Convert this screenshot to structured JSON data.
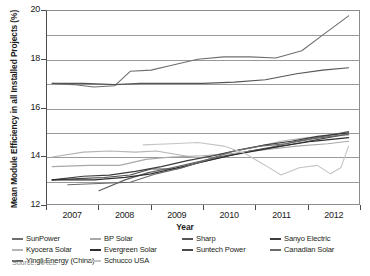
{
  "chart_data": {
    "type": "line",
    "title": "",
    "xlabel": "Year",
    "ylabel": "Mean Module Efficiency in all Installed Projects (%)",
    "x": [
      "2007",
      "2008",
      "2009",
      "2010",
      "2011",
      "2012"
    ],
    "xlim": [
      2006.5,
      2012.5
    ],
    "ylim": [
      12,
      20
    ],
    "yticks": [
      12,
      14,
      16,
      18,
      20
    ],
    "ytick_labels": [
      "12",
      "14",
      "16",
      "18",
      "20"
    ],
    "gridlines": [
      13,
      15,
      17,
      19
    ],
    "grid": true,
    "legend_position": "bottom",
    "source": "Source: NREL",
    "series": [
      {
        "name": "SunPower",
        "color": "#6e6e6e",
        "width": 1.1,
        "values": [
          17.0,
          16.95,
          17.55,
          17.9,
          18.1,
          19.8
        ],
        "points": [
          [
            2006.6,
            17.0
          ],
          [
            2007.0,
            16.95
          ],
          [
            2007.4,
            16.85
          ],
          [
            2007.8,
            16.9
          ],
          [
            2008.1,
            17.5
          ],
          [
            2008.5,
            17.55
          ],
          [
            2008.9,
            17.75
          ],
          [
            2009.4,
            18.0
          ],
          [
            2009.9,
            18.1
          ],
          [
            2010.4,
            18.1
          ],
          [
            2010.9,
            18.05
          ],
          [
            2011.4,
            18.35
          ],
          [
            2011.8,
            19.0
          ],
          [
            2012.3,
            19.8
          ]
        ]
      },
      {
        "name": "Sharp",
        "color": "#555555",
        "width": 1.1,
        "values": [
          17.0,
          17.0,
          17.0,
          17.0,
          17.1,
          17.65
        ],
        "points": [
          [
            2006.6,
            17.0
          ],
          [
            2007.2,
            17.0
          ],
          [
            2007.8,
            16.95
          ],
          [
            2008.3,
            17.0
          ],
          [
            2008.9,
            17.0
          ],
          [
            2009.5,
            17.0
          ],
          [
            2010.1,
            17.05
          ],
          [
            2010.7,
            17.15
          ],
          [
            2011.3,
            17.4
          ],
          [
            2011.8,
            17.55
          ],
          [
            2012.3,
            17.65
          ]
        ]
      },
      {
        "name": "Kyocera Solar",
        "color": "#b4b4b4",
        "width": 1.1,
        "values": [
          13.95,
          14.2,
          14.1,
          14.3,
          14.7,
          14.85
        ],
        "points": [
          [
            2006.6,
            13.95
          ],
          [
            2007.2,
            14.15
          ],
          [
            2007.7,
            14.2
          ],
          [
            2008.2,
            14.15
          ],
          [
            2008.6,
            14.2
          ],
          [
            2009.0,
            14.05
          ],
          [
            2009.4,
            13.9
          ],
          [
            2009.9,
            14.1
          ],
          [
            2010.5,
            14.35
          ],
          [
            2011.0,
            14.6
          ],
          [
            2011.5,
            14.75
          ],
          [
            2012.3,
            14.85
          ]
        ]
      },
      {
        "name": "Suntech Power",
        "color": "#4a4a4a",
        "width": 1.1,
        "values": [
          13.0,
          13.05,
          13.5,
          14.0,
          14.45,
          14.9
        ],
        "points": [
          [
            2006.6,
            13.0
          ],
          [
            2007.1,
            13.05
          ],
          [
            2007.6,
            13.1
          ],
          [
            2008.1,
            13.2
          ],
          [
            2008.5,
            13.45
          ],
          [
            2009.0,
            13.45
          ],
          [
            2009.4,
            13.7
          ],
          [
            2009.9,
            13.95
          ],
          [
            2010.4,
            14.2
          ],
          [
            2010.9,
            14.35
          ],
          [
            2011.4,
            14.55
          ],
          [
            2011.9,
            14.75
          ],
          [
            2012.3,
            14.9
          ]
        ]
      },
      {
        "name": "Yingli Energy (China)",
        "color": "#5e5e5e",
        "width": 1.1,
        "values": [
          12.55,
          12.95,
          13.6,
          14.1,
          14.55,
          15.0
        ],
        "points": [
          [
            2007.5,
            12.55
          ],
          [
            2008.0,
            13.0
          ],
          [
            2008.45,
            13.3
          ],
          [
            2008.9,
            13.5
          ],
          [
            2009.3,
            13.7
          ],
          [
            2009.8,
            13.95
          ],
          [
            2010.3,
            14.15
          ],
          [
            2010.8,
            14.35
          ],
          [
            2011.3,
            14.6
          ],
          [
            2011.8,
            14.8
          ],
          [
            2012.3,
            15.0
          ]
        ]
      },
      {
        "name": "BP Solar",
        "color": "#a8a8a8",
        "width": 1.1,
        "values": [
          13.55,
          13.6,
          13.85,
          14.05,
          14.3,
          14.6
        ],
        "points": [
          [
            2006.6,
            13.55
          ],
          [
            2007.3,
            13.6
          ],
          [
            2007.9,
            13.6
          ],
          [
            2008.4,
            13.85
          ],
          [
            2008.9,
            13.95
          ],
          [
            2009.5,
            14.0
          ],
          [
            2010.1,
            14.1
          ],
          [
            2010.7,
            14.25
          ],
          [
            2011.3,
            14.4
          ],
          [
            2011.9,
            14.5
          ],
          [
            2012.3,
            14.6
          ]
        ]
      },
      {
        "name": "Sanyo Electric",
        "color": "#3d3d3d",
        "width": 1.2,
        "values": [
          13.0,
          13.1,
          13.35,
          13.95,
          14.45,
          14.95
        ],
        "points": [
          [
            2006.6,
            13.0
          ],
          [
            2007.2,
            13.15
          ],
          [
            2007.7,
            13.2
          ],
          [
            2008.2,
            13.35
          ],
          [
            2008.7,
            13.55
          ],
          [
            2009.2,
            13.8
          ],
          [
            2009.7,
            14.0
          ],
          [
            2010.2,
            14.25
          ],
          [
            2010.7,
            14.45
          ],
          [
            2011.2,
            14.6
          ],
          [
            2011.7,
            14.8
          ],
          [
            2012.3,
            14.95
          ]
        ]
      },
      {
        "name": "Evergreen Solar",
        "color": "#2e2e2e",
        "width": 1.2,
        "values": [
          13.0,
          13.05,
          13.3,
          13.85,
          14.4,
          14.75
        ],
        "points": [
          [
            2006.6,
            13.0
          ],
          [
            2007.4,
            13.0
          ],
          [
            2008.0,
            13.1
          ],
          [
            2008.5,
            13.25
          ],
          [
            2009.0,
            13.5
          ],
          [
            2009.5,
            13.75
          ],
          [
            2010.0,
            14.0
          ],
          [
            2010.5,
            14.2
          ],
          [
            2011.0,
            14.4
          ],
          [
            2011.6,
            14.6
          ],
          [
            2012.3,
            14.75
          ]
        ]
      },
      {
        "name": "Canadian Solar",
        "color": "#6a6a6a",
        "width": 1.1,
        "values": [
          12.8,
          12.9,
          13.45,
          14.3,
          14.5,
          14.9
        ],
        "points": [
          [
            2006.9,
            12.8
          ],
          [
            2007.5,
            12.85
          ],
          [
            2008.1,
            12.9
          ],
          [
            2008.6,
            13.25
          ],
          [
            2009.1,
            13.5
          ],
          [
            2009.6,
            13.85
          ],
          [
            2010.1,
            14.2
          ],
          [
            2010.6,
            14.4
          ],
          [
            2011.1,
            14.5
          ],
          [
            2011.6,
            14.7
          ],
          [
            2012.3,
            14.9
          ]
        ]
      },
      {
        "name": "Schucco USA",
        "color": "#c4c4c4",
        "width": 1.1,
        "values": [
          14.45,
          14.6,
          14.3,
          13.6,
          13.2,
          14.4
        ],
        "points": [
          [
            2008.35,
            14.45
          ],
          [
            2008.9,
            14.5
          ],
          [
            2009.4,
            14.55
          ],
          [
            2009.9,
            14.4
          ],
          [
            2010.3,
            14.1
          ],
          [
            2010.7,
            13.6
          ],
          [
            2011.0,
            13.2
          ],
          [
            2011.35,
            13.5
          ],
          [
            2011.7,
            13.6
          ],
          [
            2011.95,
            13.25
          ],
          [
            2012.15,
            13.5
          ],
          [
            2012.3,
            14.4
          ]
        ]
      }
    ]
  },
  "legend": {
    "items": [
      {
        "label": "SunPower"
      },
      {
        "label": "Sharp"
      },
      {
        "label": "Kyocera Solar"
      },
      {
        "label": "Suntech Power"
      },
      {
        "label": "Yingli Energy (China)"
      },
      {
        "label": "BP Solar"
      },
      {
        "label": "Sanyo Electric"
      },
      {
        "label": "Evergreen Solar"
      },
      {
        "label": "Canadian Solar"
      },
      {
        "label": "Schucco USA"
      }
    ]
  },
  "axes": {
    "y_title": "Mean Module Efficiency in all Installed Projects (%)",
    "x_title": "Year",
    "y_ticks": [
      "20",
      "18",
      "16",
      "14",
      "12"
    ],
    "x_ticks": [
      "2007",
      "2008",
      "2009",
      "2010",
      "2011",
      "2012"
    ]
  },
  "footer": {
    "source": "Source: NREL"
  }
}
